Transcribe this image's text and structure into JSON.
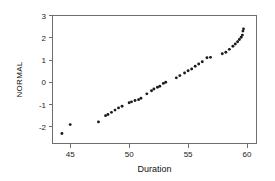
{
  "chart_data": {
    "type": "scatter",
    "title": "",
    "xlabel": "Duration",
    "ylabel": "NORMAL",
    "xlim": [
      43.5,
      60.8
    ],
    "ylim": [
      -2.75,
      3.0
    ],
    "xticks": [
      45,
      50,
      55,
      60
    ],
    "yticks": [
      -2,
      -1,
      0,
      1,
      2,
      3
    ],
    "grid": false,
    "legend": null,
    "marker": "filled-circle",
    "marker_color": "#1c1c1c",
    "frame_color": "#6e6e6e",
    "background": "#ffffff",
    "x": [
      44.3,
      45.0,
      47.4,
      48.0,
      48.2,
      48.5,
      48.8,
      49.1,
      49.4,
      50.0,
      50.2,
      50.5,
      50.8,
      51.0,
      51.5,
      51.9,
      52.1,
      52.4,
      52.6,
      52.9,
      53.1,
      54.0,
      54.3,
      54.7,
      55.0,
      55.3,
      55.6,
      55.9,
      56.2,
      56.6,
      56.9,
      57.9,
      58.2,
      58.5,
      58.8,
      59.0,
      59.2,
      59.35,
      59.5,
      59.6,
      59.65,
      59.7
    ],
    "y": [
      -2.3,
      -1.9,
      -1.78,
      -1.5,
      -1.45,
      -1.35,
      -1.25,
      -1.15,
      -1.08,
      -0.92,
      -0.88,
      -0.82,
      -0.78,
      -0.72,
      -0.52,
      -0.38,
      -0.3,
      -0.22,
      -0.18,
      -0.05,
      0.0,
      0.2,
      0.3,
      0.42,
      0.52,
      0.6,
      0.72,
      0.82,
      0.92,
      1.1,
      1.12,
      1.28,
      1.35,
      1.48,
      1.62,
      1.72,
      1.82,
      1.92,
      2.02,
      2.12,
      2.3,
      2.4
    ],
    "series_name": "NORMAL vs Duration",
    "points_count": 42
  }
}
